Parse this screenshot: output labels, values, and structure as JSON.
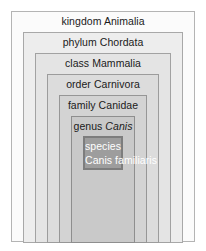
{
  "diagram": {
    "type": "nested-boxes",
    "levels": [
      {
        "id": "kingdom",
        "rank": "kingdom",
        "taxon": "Animalia",
        "taxon_italic": false,
        "fill": "#fbfbfb",
        "border": "#b4b4b4",
        "text_color": "#1a1a1a"
      },
      {
        "id": "phylum",
        "rank": "phylum",
        "taxon": "Chordata",
        "taxon_italic": false,
        "fill": "#ededed",
        "border": "#a8a8a8",
        "text_color": "#1a1a1a"
      },
      {
        "id": "class",
        "rank": "class",
        "taxon": "Mammalia",
        "taxon_italic": false,
        "fill": "#e4e4e4",
        "border": "#a2a2a2",
        "text_color": "#1a1a1a"
      },
      {
        "id": "order",
        "rank": "order",
        "taxon": "Carnivora",
        "taxon_italic": false,
        "fill": "#dcdcdc",
        "border": "#9c9c9c",
        "text_color": "#1a1a1a"
      },
      {
        "id": "family",
        "rank": "family",
        "taxon": "Canidae",
        "taxon_italic": false,
        "fill": "#d3d3d3",
        "border": "#969696",
        "text_color": "#1a1a1a"
      },
      {
        "id": "genus",
        "rank": "genus",
        "taxon": "Canis",
        "taxon_italic": true,
        "fill": "#c9c9c9",
        "border": "#8e8e8e",
        "text_color": "#1a1a1a"
      },
      {
        "id": "species",
        "rank": "species",
        "taxon": "Canis familiaris",
        "taxon_italic": true,
        "fill": "#9d9d9d",
        "border": "#7d7d7d",
        "text_color": "#ffffff"
      }
    ]
  }
}
